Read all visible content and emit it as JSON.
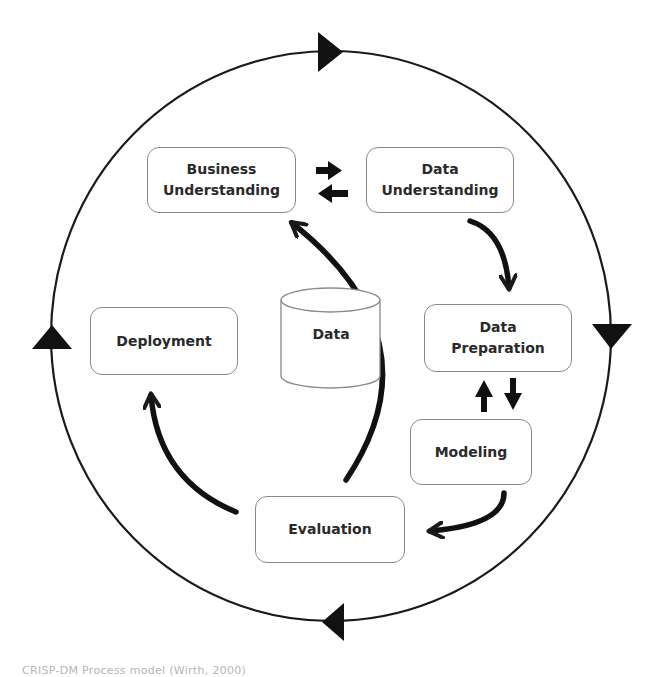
{
  "diagram": {
    "phases": {
      "business_understanding": {
        "line1": "Business",
        "line2": "Understanding"
      },
      "data_understanding": {
        "line1": "Data",
        "line2": "Understanding"
      },
      "data_preparation": {
        "line1": "Data",
        "line2": "Preparation"
      },
      "modeling": {
        "label": "Modeling"
      },
      "evaluation": {
        "label": "Evaluation"
      },
      "deployment": {
        "label": "Deployment"
      }
    },
    "data_store": {
      "label": "Data"
    },
    "outer_cycle": {
      "shape": "circle",
      "direction": "clockwise",
      "arrowheads": [
        "top",
        "right",
        "bottom",
        "left"
      ]
    },
    "flows": [
      {
        "from": "Business Understanding",
        "to": "Data Understanding",
        "style": "straight"
      },
      {
        "from": "Data Understanding",
        "to": "Business Understanding",
        "style": "straight"
      },
      {
        "from": "Data Understanding",
        "to": "Data Preparation",
        "style": "curved"
      },
      {
        "from": "Data Preparation",
        "to": "Modeling",
        "style": "straight"
      },
      {
        "from": "Modeling",
        "to": "Data Preparation",
        "style": "straight"
      },
      {
        "from": "Modeling",
        "to": "Evaluation",
        "style": "curved"
      },
      {
        "from": "Evaluation",
        "to": "Business Understanding",
        "style": "curved"
      },
      {
        "from": "Evaluation",
        "to": "Deployment",
        "style": "curved"
      }
    ],
    "colors": {
      "stroke": "#1a1a1a",
      "box_border": "#8a8a8a",
      "text": "#2a2a2a",
      "background": "#ffffff"
    }
  },
  "caption": "CRISP-DM Process model (Wirth, 2000)"
}
